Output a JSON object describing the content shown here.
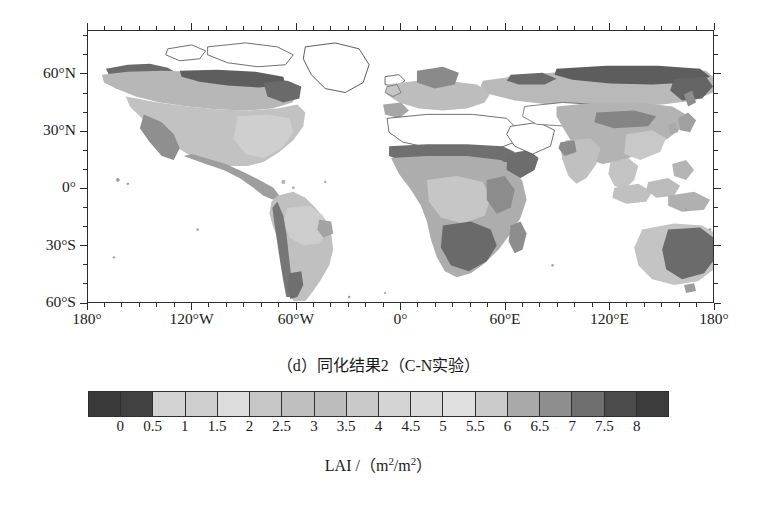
{
  "figure": {
    "caption": "（d）同化结果2（C-N实验）",
    "colorbar_title_prefix": "LAI /（m",
    "colorbar_title_mid": "/m",
    "colorbar_title_suffix": "）",
    "sup": "2"
  },
  "chart_data": {
    "type": "heatmap",
    "title": "（d）同化结果2（C-N实验）",
    "xlabel": "",
    "ylabel": "",
    "colorbar_label": "LAI /（m2/m2）",
    "projection": "equirectangular",
    "xlim": [
      -180,
      180
    ],
    "ylim": [
      -60,
      83
    ],
    "grid": false,
    "legend_position": "bottom",
    "x_ticks": [
      -180,
      -120,
      -60,
      0,
      60,
      120,
      180
    ],
    "x_tick_labels": [
      "180°",
      "120°W",
      "60°W",
      "0°",
      "60°E",
      "120°E",
      "180°"
    ],
    "x_minor_tick_interval_deg": 10,
    "y_ticks": [
      60,
      30,
      0,
      -30,
      -60
    ],
    "y_tick_labels": [
      "60°N",
      "30°N",
      "0°",
      "30°S",
      "60°S"
    ],
    "y_minor_tick_interval_deg": 10,
    "colorbar": {
      "levels": [
        0,
        0.5,
        1,
        1.5,
        2,
        2.5,
        3,
        3.5,
        4,
        4.5,
        5,
        5.5,
        6,
        6.5,
        7,
        7.5,
        8
      ],
      "tick_labels": [
        "0",
        "0.5",
        "1",
        "1.5",
        "2",
        "2.5",
        "3",
        "3.5",
        "4",
        "4.5",
        "5",
        "5.5",
        "6",
        "6.5",
        "7",
        "7.5",
        "8"
      ],
      "n_segments": 18,
      "segment_colors": [
        "#3a3a3a",
        "#414141",
        "#d2d2d2",
        "#cfcfcf",
        "#dcdcdc",
        "#c7c7c7",
        "#bfbfbf",
        "#bcbcbc",
        "#c9c9c9",
        "#d4d4d4",
        "#dadada",
        "#e0e0e0",
        "#cbcbcb",
        "#a9a9a9",
        "#8e8e8e",
        "#6f6f6f",
        "#4b4b4b",
        "#3c3c3c"
      ]
    },
    "map_classes": [
      {
        "name": "no-data / bare",
        "color": "#ffffff",
        "lai_range": "no data"
      },
      {
        "name": "very low LAI",
        "color": "#6e6e6e",
        "lai_range": "0 - 1"
      },
      {
        "name": "low-mid LAI",
        "color": "#a9a9a9",
        "lai_range": "1 - 2.5"
      },
      {
        "name": "mid LAI",
        "color": "#c3c3c3",
        "lai_range": "2.5 - 4"
      },
      {
        "name": "high LAI",
        "color": "#d6d6d6",
        "lai_range": "4 - 6"
      }
    ],
    "regions": [
      {
        "name": "Sahara",
        "lai_class": "no data"
      },
      {
        "name": "Sahel",
        "lai_class": "very low LAI"
      },
      {
        "name": "Congo Basin",
        "lai_class": "mid LAI"
      },
      {
        "name": "Southern Africa",
        "lai_class": "very low LAI"
      },
      {
        "name": "Amazon Basin",
        "lai_class": "mid LAI"
      },
      {
        "name": "Patagonia",
        "lai_class": "very low LAI"
      },
      {
        "name": "Boreal North America",
        "lai_class": "very low LAI"
      },
      {
        "name": "Eastern North America",
        "lai_class": "mid LAI"
      },
      {
        "name": "Siberia",
        "lai_class": "very low LAI"
      },
      {
        "name": "Europe",
        "lai_class": "mid LAI"
      },
      {
        "name": "Central Asia",
        "lai_class": "low-mid LAI"
      },
      {
        "name": "India",
        "lai_class": "mid LAI"
      },
      {
        "name": "Southeast Asia",
        "lai_class": "mid LAI"
      },
      {
        "name": "Australia interior",
        "lai_class": "very low LAI"
      },
      {
        "name": "Western Australia",
        "lai_class": "low-mid LAI"
      },
      {
        "name": "Arabian Peninsula",
        "lai_class": "no data"
      },
      {
        "name": "Greenland",
        "lai_class": "no data"
      },
      {
        "name": "Tibetan Plateau",
        "lai_class": "no data"
      }
    ]
  },
  "axes": {
    "y_labels": [
      {
        "text": "60°N",
        "value": 60
      },
      {
        "text": "30°N",
        "value": 30
      },
      {
        "text": "0°",
        "value": 0
      },
      {
        "text": "30°S",
        "value": -30
      },
      {
        "text": "60°S",
        "value": -60
      }
    ],
    "x_labels": [
      {
        "text": "180°",
        "value": -180
      },
      {
        "text": "120°W",
        "value": -120
      },
      {
        "text": "60°W",
        "value": -60
      },
      {
        "text": "0°",
        "value": 0
      },
      {
        "text": "60°E",
        "value": 60
      },
      {
        "text": "120°E",
        "value": 120
      },
      {
        "text": "180°",
        "value": 180
      }
    ]
  }
}
